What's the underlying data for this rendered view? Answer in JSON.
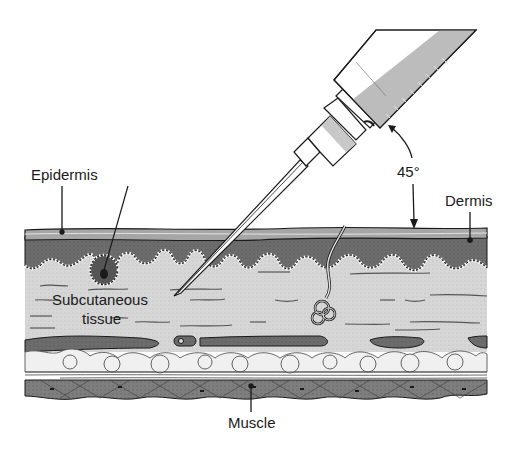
{
  "diagram": {
    "type": "anatomical cross-section",
    "labels": {
      "epidermis": "Epidermis",
      "dermis": "Dermis",
      "angle": "45°",
      "subcutaneous_line1": "Subcutaneous",
      "subcutaneous_line2": "tissue",
      "muscle": "Muscle"
    },
    "colors": {
      "background": "#ffffff",
      "epidermis": "#9a9a9a",
      "dermis": "#6e6e6e",
      "subcutaneous": "#d8d8d8",
      "fat": "#eeeeee",
      "vessel": "#6a6a6a",
      "muscle": "#7a7a7a",
      "outline": "#1a1a1a",
      "syringe_shade": "#b8b8b8"
    }
  }
}
